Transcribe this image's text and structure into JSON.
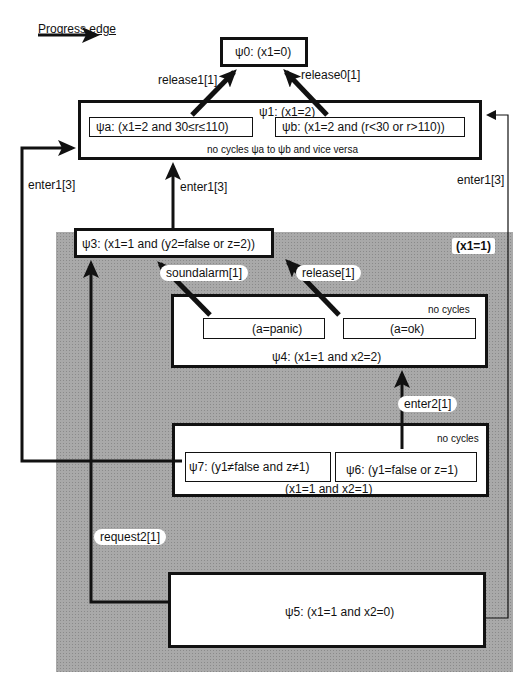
{
  "legend": {
    "label": "Progress edge"
  },
  "region": {
    "label": "(x1=1)"
  },
  "nodes": {
    "psi0": {
      "label": "ψ0: (x1=0)"
    },
    "psi1": {
      "label": "ψ1: (x1=2)",
      "note": "no cycles  ψa to  ψb and vice versa",
      "psia": "ψa:  (x1=2 and 30≤r≤110)",
      "psib": "ψb:  (x1=2 and (r<30 or r>110))"
    },
    "psi3": {
      "label": "ψ3:  (x1=1 and (y2=false or z=2))"
    },
    "psi4": {
      "label": "ψ4:  (x1=1 and x2=2)",
      "note": "no cycles",
      "panic": "(a=panic)",
      "ok": "(a=ok)"
    },
    "psi67": {
      "label": "(x1=1 and x2=1)",
      "note": "no cycles",
      "psi7": "ψ7:  (y1≠false and z≠1)",
      "psi6": "ψ6:  (y1=false or z=1)"
    },
    "psi5": {
      "label": "ψ5:  (x1=1 and x2=0)"
    }
  },
  "edges": {
    "release1": "release1[1]",
    "release0": "release0[1]",
    "enter1_left": "enter1[3]",
    "enter1_mid": "enter1[3]",
    "enter1_right": "enter1[3]",
    "soundalarm": "soundalarm[1]",
    "release": "release[1]",
    "enter2": "enter2[1]",
    "request2": "request2[1]"
  }
}
